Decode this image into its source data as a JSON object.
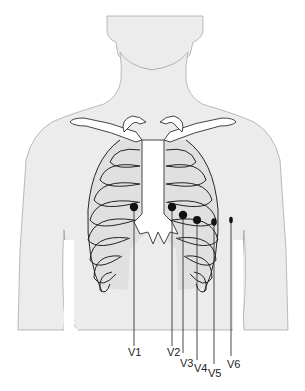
{
  "diagram": {
    "type": "ECG precordial lead placement on chest",
    "colors": {
      "skin": "#ececec",
      "outline": "#a9a9a9",
      "bone": "#ffffff",
      "electrode": "#111111",
      "text": "#222222"
    },
    "leads": [
      {
        "id": "V1",
        "label": "V1"
      },
      {
        "id": "V2",
        "label": "V2"
      },
      {
        "id": "V3",
        "label": "V3"
      },
      {
        "id": "V4",
        "label": "V4"
      },
      {
        "id": "V5",
        "label": "V5"
      },
      {
        "id": "V6",
        "label": "V6"
      }
    ]
  }
}
